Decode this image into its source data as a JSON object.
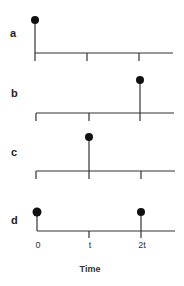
{
  "figure": {
    "x_axis": {
      "title": "Time",
      "ticks": [
        {
          "label": "0",
          "value": 0
        },
        {
          "label": "t",
          "value": 1
        },
        {
          "label": "2t",
          "value": 2
        }
      ]
    },
    "panels": [
      {
        "label": "a",
        "impulses_at": [
          0
        ]
      },
      {
        "label": "b",
        "impulses_at": [
          2
        ]
      },
      {
        "label": "c",
        "impulses_at": [
          1
        ]
      },
      {
        "label": "d",
        "impulses_at": [
          0,
          2
        ]
      }
    ],
    "colors": {
      "line": "#333333",
      "dot": "#111111"
    }
  }
}
